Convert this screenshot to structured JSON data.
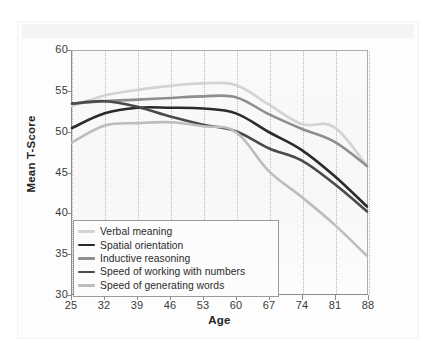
{
  "chart_data": {
    "type": "line",
    "title": "",
    "xlabel": "Age",
    "ylabel": "Mean T-Score",
    "x": [
      25,
      32,
      39,
      46,
      53,
      60,
      67,
      74,
      81,
      88
    ],
    "xticklabels": [
      "25",
      "32",
      "39",
      "46",
      "53",
      "60",
      "67",
      "74",
      "81",
      "88"
    ],
    "yticklabels": [
      "30",
      "35",
      "40",
      "45",
      "50",
      "55",
      "60"
    ],
    "xlim": [
      25,
      88
    ],
    "ylim": [
      30,
      60
    ],
    "ytick_step": 5,
    "grid": "vertical-dotted",
    "legend_position": "lower-left",
    "series": [
      {
        "name": "Verbal meaning",
        "color": "#d3d3d3",
        "width": 2.6,
        "values": [
          53.2,
          54.5,
          55.2,
          55.7,
          56.0,
          55.8,
          53.4,
          51.0,
          50.6,
          45.8
        ]
      },
      {
        "name": "Spatial orientation",
        "color": "#2a2a2a",
        "width": 2.6,
        "values": [
          50.5,
          52.3,
          53.0,
          53.0,
          52.9,
          52.3,
          50.0,
          47.8,
          44.6,
          40.8
        ]
      },
      {
        "name": "Inductive reasoning",
        "color": "#8e8e8e",
        "width": 2.6,
        "values": [
          53.5,
          53.8,
          54.0,
          54.2,
          54.4,
          54.3,
          52.2,
          50.4,
          48.8,
          45.8
        ]
      },
      {
        "name": "Speed of working with numbers",
        "color": "#4a4a4a",
        "width": 2.6,
        "values": [
          53.5,
          53.8,
          53.1,
          51.9,
          50.9,
          50.1,
          48.0,
          46.5,
          43.6,
          40.2
        ]
      },
      {
        "name": "Speed of generating words",
        "color": "#bdbdbd",
        "width": 2.6,
        "values": [
          48.7,
          50.8,
          51.1,
          51.2,
          50.7,
          50.0,
          45.2,
          42.0,
          38.6,
          34.7
        ]
      }
    ]
  },
  "legend": {
    "items": [
      {
        "label": "Verbal meaning"
      },
      {
        "label": "Spatial orientation"
      },
      {
        "label": "Inductive reasoning"
      },
      {
        "label": "Speed of working with numbers"
      },
      {
        "label": "Speed of generating words"
      }
    ]
  }
}
